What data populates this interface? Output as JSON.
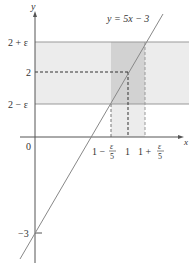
{
  "diagram": {
    "equation_label": "y = 5x − 3",
    "axes": {
      "x_label": "x",
      "y_label": "y",
      "origin_label": "0"
    },
    "y_ticks": {
      "upper": "2 + ε",
      "center": "2",
      "lower": "2 − ε",
      "intercept": "−3"
    },
    "x_ticks": {
      "left_prefix": "1 −",
      "center": "1",
      "right_prefix": "1 +",
      "frac_num": "ε",
      "frac_den": "5"
    },
    "colors": {
      "band": "#ececec",
      "strip": "#d2d2d2",
      "line": "#888888",
      "axis": "#555555"
    }
  }
}
